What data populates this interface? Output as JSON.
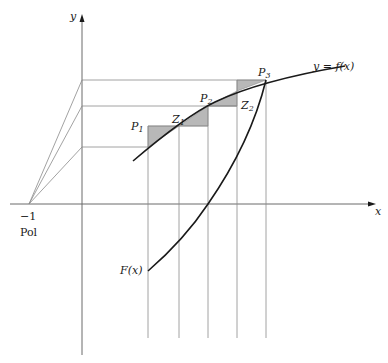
{
  "diagram": {
    "axes": {
      "x_label": "x",
      "y_label": "y"
    },
    "pole": {
      "value_label": "−1",
      "name_label": "Pol"
    },
    "curves": {
      "f_label": "y = f(x)",
      "F_label": "F(x)"
    },
    "points": [
      {
        "name": "P",
        "sub": "1"
      },
      {
        "name": "P",
        "sub": "2"
      },
      {
        "name": "P",
        "sub": "3"
      }
    ],
    "intermediate": [
      {
        "name": "Z",
        "sub": "1"
      },
      {
        "name": "Z",
        "sub": "2"
      }
    ]
  }
}
